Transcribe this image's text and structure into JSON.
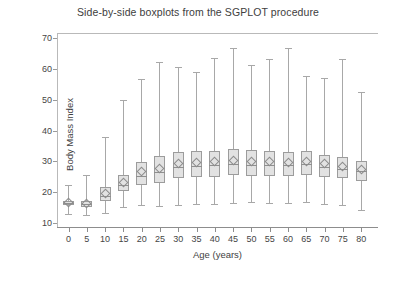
{
  "chart_data": {
    "type": "box",
    "title": "Side-by-side boxplots from the SGPLOT procedure",
    "xlabel": "Age (years)",
    "ylabel": "Body Mass Index",
    "categories": [
      "0",
      "5",
      "10",
      "15",
      "20",
      "25",
      "30",
      "35",
      "40",
      "45",
      "50",
      "55",
      "60",
      "65",
      "70",
      "75",
      "80"
    ],
    "xtick_labels": [
      "0",
      "5",
      "10",
      "15",
      "20",
      "25",
      "30",
      "35",
      "40",
      "45",
      "50",
      "55",
      "60",
      "65",
      "70",
      "75",
      "80"
    ],
    "ytick_labels": [
      "10",
      "20",
      "30",
      "40",
      "50",
      "60",
      "70"
    ],
    "yticks": [
      10,
      20,
      30,
      40,
      50,
      60,
      70
    ],
    "ylim": [
      8.5,
      71.5
    ],
    "grid": false,
    "legend": "none",
    "colors": {
      "box_fill": "#e2e2e2",
      "box_edge": "#9c9c9c",
      "whisker": "#a8a8a8",
      "median": "#8f8f8f",
      "mean_marker": "#8c8c8c",
      "frame": "#b9b9b9",
      "text": "#3f3f3f",
      "background": "#ffffff"
    },
    "marker_note": "open diamond marker denotes the mean of each group",
    "boxes": [
      {
        "category": "0",
        "min": 13.0,
        "q1": 15.9,
        "median": 16.5,
        "mean": 16.6,
        "q3": 17.3,
        "max": 22.5
      },
      {
        "category": "5",
        "min": 12.8,
        "q1": 15.3,
        "median": 16.1,
        "mean": 16.3,
        "q3": 17.2,
        "max": 25.6
      },
      {
        "category": "10",
        "min": 13.2,
        "q1": 17.1,
        "median": 18.8,
        "mean": 19.5,
        "q3": 21.6,
        "max": 37.8
      },
      {
        "category": "15",
        "min": 15.2,
        "q1": 20.3,
        "median": 22.5,
        "mean": 23.3,
        "q3": 25.6,
        "max": 50.0
      },
      {
        "category": "20",
        "min": 15.9,
        "q1": 22.4,
        "median": 25.4,
        "mean": 26.6,
        "q3": 29.8,
        "max": 56.5
      },
      {
        "category": "25",
        "min": 15.5,
        "q1": 23.0,
        "median": 26.6,
        "mean": 27.8,
        "q3": 31.8,
        "max": 62.0
      },
      {
        "category": "30",
        "min": 16.0,
        "q1": 24.5,
        "median": 28.2,
        "mean": 29.4,
        "q3": 33.0,
        "max": 60.5
      },
      {
        "category": "35",
        "min": 16.4,
        "q1": 24.9,
        "median": 28.5,
        "mean": 29.7,
        "q3": 33.4,
        "max": 59.0
      },
      {
        "category": "40",
        "min": 16.2,
        "q1": 25.1,
        "median": 28.8,
        "mean": 30.0,
        "q3": 33.5,
        "max": 63.5
      },
      {
        "category": "45",
        "min": 16.5,
        "q1": 25.5,
        "median": 29.2,
        "mean": 30.4,
        "q3": 34.0,
        "max": 66.8
      },
      {
        "category": "50",
        "min": 16.8,
        "q1": 25.4,
        "median": 29.0,
        "mean": 30.1,
        "q3": 33.6,
        "max": 61.2
      },
      {
        "category": "55",
        "min": 16.5,
        "q1": 25.3,
        "median": 28.9,
        "mean": 30.0,
        "q3": 33.4,
        "max": 63.0
      },
      {
        "category": "60",
        "min": 16.6,
        "q1": 25.3,
        "median": 28.8,
        "mean": 29.8,
        "q3": 33.0,
        "max": 66.5
      },
      {
        "category": "65",
        "min": 16.9,
        "q1": 25.6,
        "median": 29.1,
        "mean": 30.0,
        "q3": 33.3,
        "max": 57.5
      },
      {
        "category": "70",
        "min": 16.4,
        "q1": 25.0,
        "median": 28.3,
        "mean": 29.2,
        "q3": 32.2,
        "max": 57.0
      },
      {
        "category": "75",
        "min": 15.9,
        "q1": 24.5,
        "median": 27.6,
        "mean": 28.5,
        "q3": 31.3,
        "max": 63.2
      },
      {
        "category": "80",
        "min": 14.2,
        "q1": 23.8,
        "median": 26.8,
        "mean": 27.5,
        "q3": 30.2,
        "max": 52.3
      }
    ]
  }
}
